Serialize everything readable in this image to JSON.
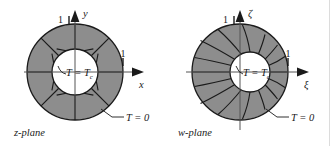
{
  "figure": {
    "background_color": "#ffffff",
    "shade_color": "#8d8d8d",
    "line_color": "#1a1a1a",
    "inner_fill": "#ffffff"
  },
  "panels": [
    {
      "id": "z-plane",
      "caption": "z-plane",
      "axis_vertical_label": "y",
      "axis_horizontal_label": "x",
      "tick_vertical": "1",
      "tick_horizontal": "1",
      "inner_boundary_label": "T = T",
      "inner_boundary_sub": "c",
      "outer_boundary_label": "T = 0",
      "geometry": {
        "center_x": 75,
        "center_y": 72,
        "outer_radius": 48,
        "inner_radius": 23,
        "sector_count": 16
      }
    },
    {
      "id": "w-plane",
      "caption": "w-plane",
      "axis_vertical_label": "ζ",
      "axis_horizontal_label": "ξ",
      "tick_vertical": "1",
      "tick_horizontal": "1",
      "inner_boundary_label": "T = T",
      "inner_boundary_sub": "c",
      "outer_boundary_label": "T = 0",
      "geometry": {
        "center_x": 240,
        "center_y": 72,
        "outer_radius": 48,
        "inner_center_x": 250,
        "inner_center_y": 72,
        "inner_radius": 20,
        "sector_count": 16
      }
    }
  ]
}
